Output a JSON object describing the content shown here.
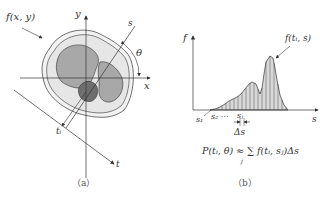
{
  "panel_a": {
    "caption": "（a）",
    "function_label": "f(x, y)",
    "axis_x": "x",
    "axis_y": "y",
    "axis_s": "s",
    "axis_t": "t",
    "angle_label": "θ",
    "ti_label": "tᵢ"
  },
  "panel_b": {
    "caption": "（b）",
    "axis_f": "f",
    "axis_s": "s",
    "curve_label": "f(tᵢ, s)",
    "s1_label": "s₁",
    "s2_label": "s₂ ···",
    "sj_label": "sⱼ",
    "delta_label": "Δs",
    "formula": "P(tᵢ, θ) ≈ ∑ f(tᵢ, sⱼ)Δs",
    "formula_sub": "j"
  },
  "colors": {
    "line": "#333333",
    "region_light": "#e6e6e6",
    "region_mid": "#a8a8a8",
    "region_dark": "#6e6e6e"
  }
}
